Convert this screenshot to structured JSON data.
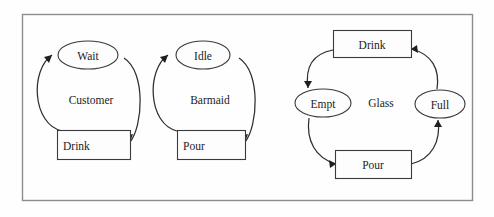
{
  "figure": {
    "frame_color": "#8d8d90",
    "background_color": "#fefefe",
    "shape_stroke_color": "#3a3a3a",
    "edge_color": "#2e2e2e",
    "text_color": "#1c1c1c"
  },
  "clusters": [
    {
      "name": "customer",
      "label": "Customer",
      "nodes": [
        {
          "id": "customer-wait",
          "label": "Wait",
          "shape": "ellipse"
        },
        {
          "id": "customer-drink",
          "label": "Drink",
          "shape": "rectangle"
        }
      ],
      "transitions": [
        {
          "from": "Drink",
          "to": "Wait",
          "side": "left"
        },
        {
          "from": "Wait",
          "to": "Drink",
          "side": "right"
        }
      ]
    },
    {
      "name": "barmaid",
      "label": "Barmaid",
      "nodes": [
        {
          "id": "barmaid-idle",
          "label": "Idle",
          "shape": "ellipse"
        },
        {
          "id": "barmaid-pour",
          "label": "Pour",
          "shape": "rectangle"
        }
      ],
      "transitions": [
        {
          "from": "Pour",
          "to": "Idle",
          "side": "left"
        },
        {
          "from": "Idle",
          "to": "Pour",
          "side": "right"
        }
      ]
    },
    {
      "name": "glass",
      "label": "Glass",
      "nodes": [
        {
          "id": "glass-drink",
          "label": "Drink",
          "shape": "rectangle"
        },
        {
          "id": "glass-empt",
          "label": "Empt",
          "shape": "ellipse"
        },
        {
          "id": "glass-pour",
          "label": "Pour",
          "shape": "rectangle"
        },
        {
          "id": "glass-full",
          "label": "Full",
          "shape": "ellipse"
        }
      ],
      "transitions": [
        {
          "from": "Drink",
          "to": "Empt",
          "side": "upper-left"
        },
        {
          "from": "Empt",
          "to": "Pour",
          "side": "lower-left"
        },
        {
          "from": "Pour",
          "to": "Full",
          "side": "lower-right"
        },
        {
          "from": "Full",
          "to": "Drink",
          "side": "upper-right"
        }
      ]
    }
  ]
}
